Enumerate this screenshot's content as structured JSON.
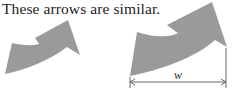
{
  "caption": "These arrows are similar.",
  "figures": [
    {
      "name": "small-arrow",
      "color": "#9a9a9a"
    },
    {
      "name": "large-arrow",
      "color": "#9a9a9a"
    }
  ],
  "dimension": {
    "label": "w",
    "color": "#666666"
  }
}
